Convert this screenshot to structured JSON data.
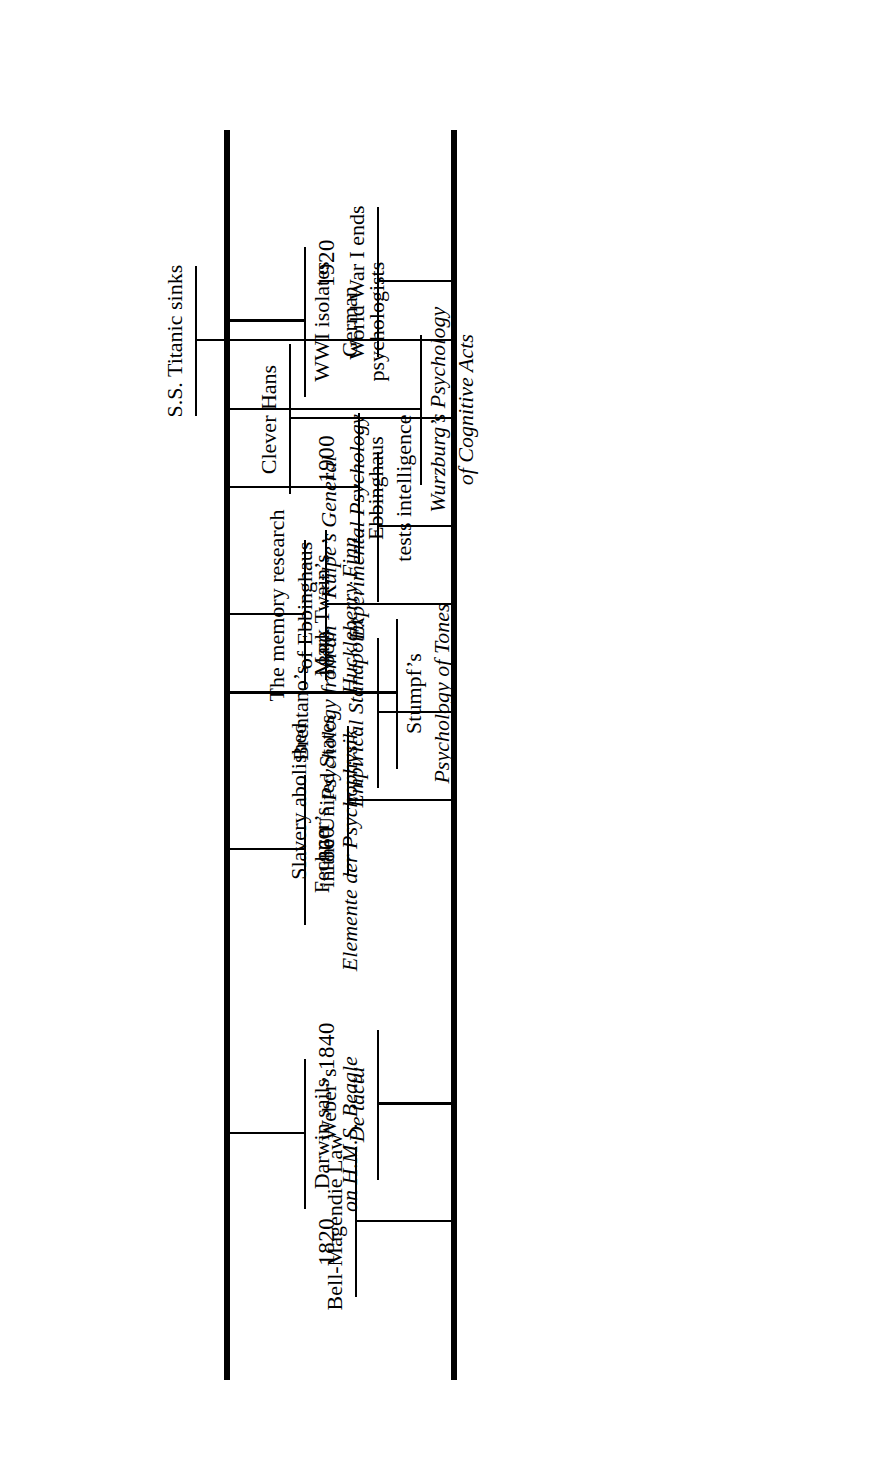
{
  "figure": {
    "kind": "historical-timeline",
    "orientation": "rotated-90-counterclockwise",
    "tracks": 2
  },
  "chart_data": {
    "type": "timeline",
    "title": "",
    "xlabel": "",
    "ylabel": "",
    "xlim": [
      1812,
      1930
    ],
    "grid": false,
    "legend": null,
    "axis_ticks": [
      "1820",
      "1840",
      "1860",
      "1880",
      "1900",
      "1920"
    ],
    "axis_tick_values": [
      1820,
      1840,
      1860,
      1880,
      1900,
      1920
    ],
    "tracks": [
      {
        "name": "upper-track",
        "events": [
          {
            "year": 1822,
            "lines": [
              "Bell-Magendie Law"
            ],
            "italic": [
              false
            ]
          },
          {
            "year": 1834,
            "lines": [
              "Weber’s",
              "De tactu"
            ],
            "italic": [
              false,
              true
            ]
          },
          {
            "year": 1865,
            "lines": [
              "Slavery abolished",
              "in the United States"
            ],
            "italic": [
              false,
              false
            ]
          },
          {
            "year": 1874,
            "lines": [
              "Brentano’s",
              "Psychology from an",
              "Empirical Standpoint"
            ],
            "italic": [
              false,
              true,
              true
            ]
          },
          {
            "year": 1885,
            "lines": [
              "The memory research",
              "of Ebbinghaus"
            ],
            "italic": [
              false,
              false
            ]
          },
          {
            "year": 1893,
            "lines": [
              "Külpe’s General",
              "Experimental Psychology"
            ],
            "italic": [
              true,
              true
            ]
          },
          {
            "year": 1904,
            "lines": [
              "Clever Hans"
            ],
            "italic": [
              false
            ]
          },
          {
            "year": 1912,
            "lines": [
              "S.S. Titanic sinks"
            ],
            "italic": [
              false
            ]
          },
          {
            "year": 1918,
            "lines": [
              "World War I ends"
            ],
            "italic": [
              false
            ]
          }
        ]
      },
      {
        "name": "lower-track",
        "events": [
          {
            "year": 1831,
            "lines": [
              "Darwin sails",
              "on H.M.S. Beagle"
            ],
            "italic": [
              false,
              true
            ]
          },
          {
            "year": 1860,
            "lines": [
              "Fechner’s",
              "Elemente der Psychophysik"
            ],
            "italic": [
              false,
              true
            ]
          },
          {
            "year": 1876,
            "lines": [
              "Stumpf’s",
              "Psychology of Tones"
            ],
            "italic": [
              false,
              true
            ]
          },
          {
            "year": 1884,
            "lines": [
              "Mark Twain’s",
              "Huckleberry Finn"
            ],
            "italic": [
              false,
              true
            ]
          },
          {
            "year": 1897,
            "lines": [
              "Ebbinghaus",
              "tests intelligence"
            ],
            "italic": [
              false,
              false
            ]
          },
          {
            "year": 1905,
            "lines": [
              "Wurzburg’s Psychology",
              "of Cognitive Acts"
            ],
            "italic": [
              true,
              true
            ]
          },
          {
            "year": 1914,
            "lines": [
              "WWI isolates",
              "German",
              "psychologists"
            ],
            "italic": [
              false,
              false,
              false
            ]
          }
        ]
      }
    ]
  },
  "decades": [
    {
      "label": "1820"
    },
    {
      "label": "1840"
    },
    {
      "label": "1860"
    },
    {
      "label": "1880"
    },
    {
      "label": "1900"
    },
    {
      "label": "1920"
    }
  ],
  "colors": {
    "ink": "#000000",
    "paper": "#ffffff"
  }
}
